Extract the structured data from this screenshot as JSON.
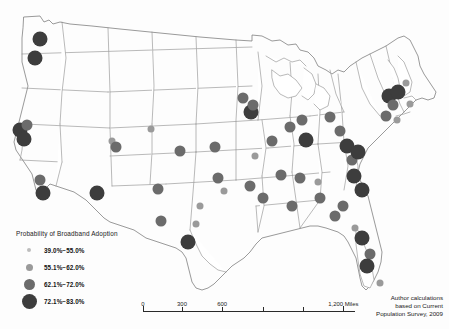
{
  "figure": {
    "type": "proportional-symbol-map",
    "region": "Contiguous United States",
    "background_color": "#fdfdfd",
    "state_stroke_color": "#8c8c8c"
  },
  "legend": {
    "title": "Probability of Broadband Adoption",
    "classes": [
      {
        "label": "39.0%−55.0%",
        "diameter": 4,
        "color": "#bdbdbd",
        "min": 39.0,
        "max": 55.0
      },
      {
        "label": "55.1%−62.0%",
        "diameter": 7,
        "color": "#9a9a9a",
        "min": 55.1,
        "max": 62.0
      },
      {
        "label": "62.1%−72.0%",
        "diameter": 11,
        "color": "#6b6b6b",
        "min": 62.1,
        "max": 72.0
      },
      {
        "label": "72.1%−83.0%",
        "diameter": 15,
        "color": "#3d3d3d",
        "min": 72.1,
        "max": 83.0
      }
    ]
  },
  "scale_bar": {
    "units": "Miles",
    "ticks": [
      {
        "value": "0",
        "pct": 0
      },
      {
        "value": "300",
        "pct": 18.4
      },
      {
        "value": "600",
        "pct": 37.3
      },
      {
        "value": "",
        "pct": 56.6
      },
      {
        "value": "",
        "pct": 75.5
      },
      {
        "value": "1,200 Miles",
        "pct": 94.5
      }
    ]
  },
  "attribution": {
    "line1": "Author calculations",
    "line2": "based on Current",
    "line3": "Population Survey, 2009"
  },
  "chart_data": {
    "type": "scatter",
    "title": "Probability of Broadband Adoption",
    "xlabel": "",
    "ylabel": "",
    "value_field": "probability_class",
    "size_encodes": "probability of broadband adoption",
    "color_encodes": "probability of broadband adoption",
    "classes": [
      "39.0%-55.0%",
      "55.1%-62.0%",
      "62.1%-72.0%",
      "72.1%-83.0%"
    ],
    "points": [
      {
        "x": 40,
        "y": 39,
        "class": 3
      },
      {
        "x": 35,
        "y": 58,
        "class": 3
      },
      {
        "x": 20,
        "y": 130,
        "class": 3
      },
      {
        "x": 27,
        "y": 125,
        "class": 2
      },
      {
        "x": 24,
        "y": 139,
        "class": 3
      },
      {
        "x": 40,
        "y": 180,
        "class": 2
      },
      {
        "x": 43,
        "y": 193,
        "class": 3
      },
      {
        "x": 97,
        "y": 193,
        "class": 3
      },
      {
        "x": 112,
        "y": 141,
        "class": 1
      },
      {
        "x": 116,
        "y": 147,
        "class": 2
      },
      {
        "x": 151,
        "y": 129,
        "class": 1
      },
      {
        "x": 158,
        "y": 189,
        "class": 2
      },
      {
        "x": 161,
        "y": 221,
        "class": 2
      },
      {
        "x": 180,
        "y": 151,
        "class": 2
      },
      {
        "x": 188,
        "y": 242,
        "class": 3
      },
      {
        "x": 215,
        "y": 147,
        "class": 2
      },
      {
        "x": 218,
        "y": 178,
        "class": 2
      },
      {
        "x": 243,
        "y": 98,
        "class": 2
      },
      {
        "x": 251,
        "y": 112,
        "class": 3
      },
      {
        "x": 253,
        "y": 105,
        "class": 2
      },
      {
        "x": 272,
        "y": 141,
        "class": 2
      },
      {
        "x": 255,
        "y": 156,
        "class": 1
      },
      {
        "x": 250,
        "y": 186,
        "class": 2
      },
      {
        "x": 263,
        "y": 198,
        "class": 2
      },
      {
        "x": 281,
        "y": 175,
        "class": 2
      },
      {
        "x": 290,
        "y": 127,
        "class": 2
      },
      {
        "x": 302,
        "y": 120,
        "class": 2
      },
      {
        "x": 306,
        "y": 140,
        "class": 3
      },
      {
        "x": 292,
        "y": 206,
        "class": 2
      },
      {
        "x": 300,
        "y": 178,
        "class": 2
      },
      {
        "x": 318,
        "y": 182,
        "class": 1
      },
      {
        "x": 320,
        "y": 198,
        "class": 2
      },
      {
        "x": 330,
        "y": 117,
        "class": 2
      },
      {
        "x": 340,
        "y": 131,
        "class": 2
      },
      {
        "x": 347,
        "y": 146,
        "class": 3
      },
      {
        "x": 352,
        "y": 160,
        "class": 2
      },
      {
        "x": 358,
        "y": 152,
        "class": 3
      },
      {
        "x": 354,
        "y": 176,
        "class": 3
      },
      {
        "x": 362,
        "y": 190,
        "class": 3
      },
      {
        "x": 343,
        "y": 206,
        "class": 2
      },
      {
        "x": 335,
        "y": 216,
        "class": 2
      },
      {
        "x": 355,
        "y": 228,
        "class": 1
      },
      {
        "x": 362,
        "y": 238,
        "class": 3
      },
      {
        "x": 370,
        "y": 254,
        "class": 2
      },
      {
        "x": 367,
        "y": 266,
        "class": 3
      },
      {
        "x": 380,
        "y": 283,
        "class": 1
      },
      {
        "x": 389,
        "y": 96,
        "class": 3
      },
      {
        "x": 398,
        "y": 92,
        "class": 3
      },
      {
        "x": 393,
        "y": 105,
        "class": 2
      },
      {
        "x": 386,
        "y": 116,
        "class": 2
      },
      {
        "x": 397,
        "y": 120,
        "class": 1
      },
      {
        "x": 406,
        "y": 83,
        "class": 1
      },
      {
        "x": 410,
        "y": 104,
        "class": 1
      },
      {
        "x": 224,
        "y": 191,
        "class": 1
      },
      {
        "x": 200,
        "y": 206,
        "class": 1
      },
      {
        "x": 196,
        "y": 224,
        "class": 1
      }
    ]
  }
}
